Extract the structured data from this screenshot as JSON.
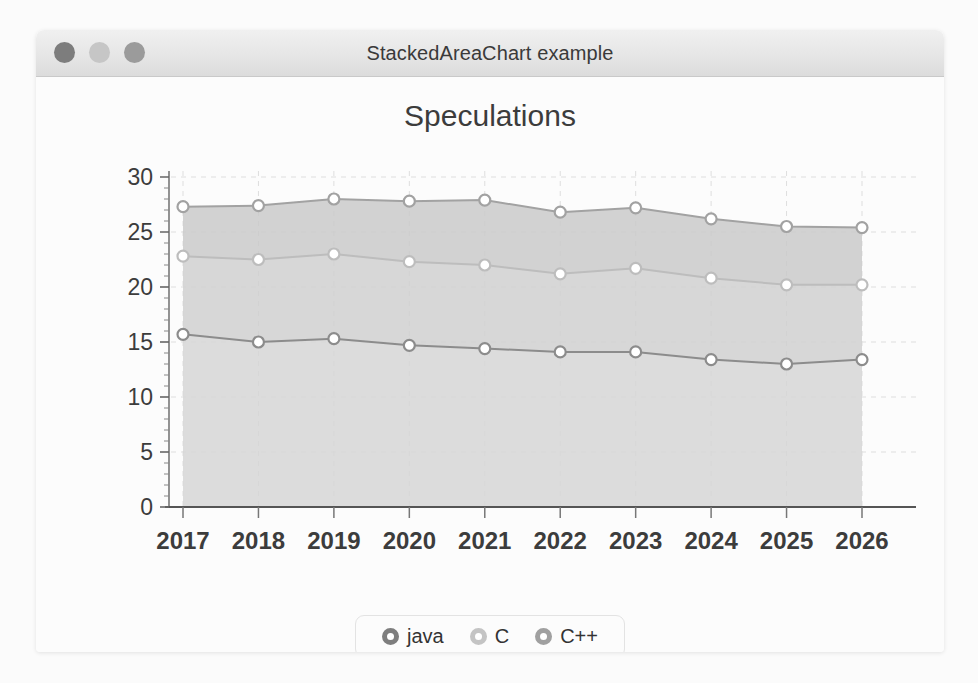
{
  "window": {
    "title": "StackedAreaChart example",
    "controls": [
      {
        "name": "close",
        "color": "#7d7d7d"
      },
      {
        "name": "minimize",
        "color": "#c6c6c6"
      },
      {
        "name": "zoom",
        "color": "#9b9b9b"
      }
    ]
  },
  "chart_data": {
    "type": "area",
    "stacked": true,
    "title": "Speculations",
    "xlabel": "",
    "ylabel": "",
    "categories": [
      "2017",
      "2018",
      "2019",
      "2020",
      "2021",
      "2022",
      "2023",
      "2024",
      "2025",
      "2026"
    ],
    "ylim": [
      0,
      30
    ],
    "yticks": [
      0,
      5,
      10,
      15,
      20,
      25,
      30
    ],
    "ytick_labels": [
      "0",
      "5",
      "10",
      "15",
      "20",
      "25",
      "30"
    ],
    "minor_ticks": true,
    "grid": true,
    "grid_style": "dashed",
    "legend_position": "bottom",
    "series": [
      {
        "name": "java",
        "color": "#8c8c8c",
        "fill": "#d6d6d6",
        "values": [
          15.7,
          15.0,
          15.3,
          14.7,
          14.4,
          14.1,
          14.1,
          13.4,
          13.0,
          13.4
        ]
      },
      {
        "name": "C",
        "color": "#bdbdbd",
        "fill": "#d0d0d0",
        "values": [
          7.1,
          7.5,
          7.7,
          7.6,
          7.6,
          7.1,
          7.6,
          7.4,
          7.2,
          6.8
        ]
      },
      {
        "name": "C++",
        "color": "#a2a2a2",
        "fill": "#cacaca",
        "values": [
          4.5,
          4.9,
          5.0,
          5.5,
          5.9,
          5.6,
          5.5,
          5.4,
          5.3,
          5.2
        ]
      }
    ],
    "cumulative": [
      {
        "name": "java",
        "values": [
          15.7,
          15.0,
          15.3,
          14.7,
          14.4,
          14.1,
          14.1,
          13.4,
          13.0,
          13.4
        ]
      },
      {
        "name": "java+C",
        "values": [
          22.8,
          22.5,
          23.0,
          22.3,
          22.0,
          21.2,
          21.7,
          20.8,
          20.2,
          20.2
        ]
      },
      {
        "name": "java+C+C++",
        "values": [
          27.3,
          27.4,
          28.0,
          27.8,
          27.9,
          26.8,
          27.2,
          26.2,
          25.5,
          25.4
        ]
      }
    ]
  },
  "legend": {
    "items": [
      {
        "label": "java",
        "color": "#7e7e7e"
      },
      {
        "label": "C",
        "color": "#c4c4c4"
      },
      {
        "label": "C++",
        "color": "#a0a0a0"
      }
    ]
  }
}
